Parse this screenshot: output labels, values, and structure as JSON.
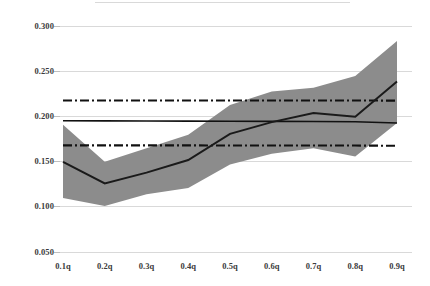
{
  "chart_data": {
    "type": "line",
    "title": "",
    "subtitle": "",
    "xlabel": "",
    "ylabel": "",
    "categories": [
      "0.1q",
      "0.2q",
      "0.3q",
      "0.4q",
      "0.5q",
      "0.6q",
      "0.7q",
      "0.8q",
      "0.9q"
    ],
    "ylim": [
      0.05,
      0.3
    ],
    "yticks": [
      "0.050",
      "0.100",
      "0.150",
      "0.200",
      "0.250",
      "0.300"
    ],
    "ytick_values": [
      0.05,
      0.1,
      0.15,
      0.2,
      0.25,
      0.3
    ],
    "grid": "horizontal",
    "legend_position": "none",
    "series": [
      {
        "name": "Quantile estimate",
        "style": "solid-line",
        "color": "#1a1a1a",
        "values": [
          0.15,
          0.126,
          0.138,
          0.152,
          0.181,
          0.194,
          0.204,
          0.2,
          0.239
        ]
      },
      {
        "name": "Confidence band upper",
        "style": "shaded-area",
        "color": "#8c8c8c",
        "values": [
          0.191,
          0.15,
          0.165,
          0.18,
          0.213,
          0.228,
          0.232,
          0.245,
          0.284
        ]
      },
      {
        "name": "Confidence band lower",
        "style": "shaded-area",
        "color": "#8c8c8c",
        "values": [
          0.11,
          0.101,
          0.114,
          0.121,
          0.147,
          0.159,
          0.165,
          0.156,
          0.193
        ]
      },
      {
        "name": "OLS estimate",
        "style": "solid-reference-line",
        "color": "#111111",
        "values": [
          0.1955,
          0.1954,
          0.1953,
          0.1951,
          0.195,
          0.1948,
          0.1946,
          0.1944,
          0.193
        ]
      },
      {
        "name": "OLS upper confidence limit",
        "style": "dash-dot-reference-line",
        "color": "#111111",
        "values": [
          0.218,
          0.218,
          0.218,
          0.218,
          0.218,
          0.218,
          0.218,
          0.218,
          0.2178
        ]
      },
      {
        "name": "OLS lower confidence limit",
        "style": "dash-dot-reference-line",
        "color": "#111111",
        "values": [
          0.1682,
          0.1682,
          0.1682,
          0.1682,
          0.1681,
          0.1681,
          0.168,
          0.168,
          0.1678
        ]
      }
    ]
  },
  "axes": {
    "y_labels": [
      "0.300",
      "0.250",
      "0.200",
      "0.150",
      "0.100",
      "0.050"
    ],
    "x_labels": [
      "0.1q",
      "0.2q",
      "0.3q",
      "0.4q",
      "0.5q",
      "0.6q",
      "0.7q",
      "0.8q",
      "0.9q"
    ]
  },
  "colors": {
    "band_fill": "#8c8c8c",
    "line": "#1a1a1a",
    "reference_line": "#111111",
    "gridline": "#d9d9d9",
    "tick_text": "#3b3b3b",
    "background": "#ffffff"
  }
}
